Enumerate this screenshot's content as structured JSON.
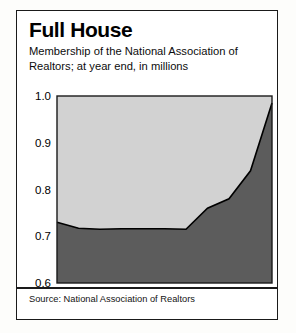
{
  "panel": {
    "title": "Full House",
    "subtitle": "Membership of the National Association of Realtors; at year end, in millions",
    "source": "Source: National Association of Realtors"
  },
  "colors": {
    "upper_fill": "#d2d2d2",
    "lower_fill": "#5c5c5c",
    "line": "#000000",
    "frame": "#1a1a1a",
    "text": "#000000",
    "background": "#ffffff"
  },
  "chart_data": {
    "type": "area",
    "title": "Full House",
    "subtitle": "Membership of the National Association of Realtors; at year end, in millions",
    "xlabel": "",
    "ylabel": "",
    "categories": [
      "1993",
      "'94",
      "'95",
      "'96",
      "'97",
      "'98",
      "'99",
      "'00",
      "'01",
      "'02",
      "'03"
    ],
    "x": [
      1993,
      1994,
      1995,
      1996,
      1997,
      1998,
      1999,
      2000,
      2001,
      2002,
      2003
    ],
    "values": [
      0.73,
      0.717,
      0.715,
      0.716,
      0.716,
      0.716,
      0.715,
      0.76,
      0.78,
      0.84,
      0.985
    ],
    "series": [
      {
        "name": "Membership (millions)",
        "values": [
          0.73,
          0.717,
          0.715,
          0.716,
          0.716,
          0.716,
          0.715,
          0.76,
          0.78,
          0.84,
          0.985
        ]
      }
    ],
    "ylim": [
      0.6,
      1.0
    ],
    "yticks": [
      0.6,
      0.7,
      0.8,
      0.9,
      1.0
    ],
    "ytick_labels": [
      "0.6",
      "0.7",
      "0.8",
      "0.9",
      "1.0"
    ],
    "xtick_labels": [
      "1993",
      "'94",
      "'95",
      "'96",
      "'97",
      "'98",
      "'99",
      "'00",
      "'01",
      "'02",
      "'03"
    ],
    "grid": false,
    "legend": "none",
    "fill_below_color": "#5c5c5c",
    "fill_above_color": "#d2d2d2",
    "source": "Source: National Association of Realtors"
  }
}
